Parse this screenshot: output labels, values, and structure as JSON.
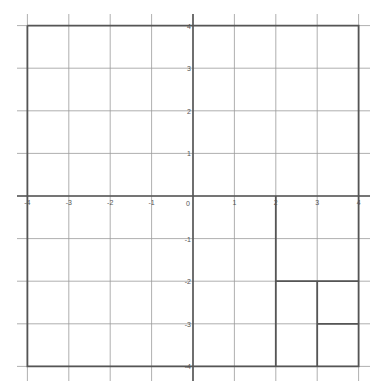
{
  "diagram": {
    "type": "coordinate-grid",
    "x_range": [
      -4,
      4
    ],
    "y_range": [
      -4,
      4
    ],
    "x_ticks": [
      "-4",
      "-3",
      "-2",
      "-1",
      "0",
      "1",
      "2",
      "3",
      "4"
    ],
    "y_ticks": [
      "4",
      "3",
      "2",
      "1",
      "-1",
      "-2",
      "-3",
      "-4"
    ],
    "origin_label": "0",
    "colors": {
      "grid": "#9a9a9a",
      "axis": "#555555",
      "shape": "#555555"
    },
    "shapes": [
      {
        "name": "boundary-square",
        "points": [
          [
            -4,
            4
          ],
          [
            4,
            4
          ],
          [
            4,
            -4
          ],
          [
            -4,
            -4
          ]
        ]
      },
      {
        "name": "rect-x2-4-y0-neg4",
        "points": [
          [
            2,
            0
          ],
          [
            2,
            -4
          ]
        ]
      },
      {
        "name": "line-y-neg2",
        "points": [
          [
            2,
            -2
          ],
          [
            4,
            -2
          ]
        ]
      },
      {
        "name": "line-x3",
        "points": [
          [
            3,
            -2
          ],
          [
            3,
            -4
          ]
        ]
      },
      {
        "name": "line-y-neg3",
        "points": [
          [
            3,
            -3
          ],
          [
            4,
            -3
          ]
        ]
      }
    ]
  }
}
